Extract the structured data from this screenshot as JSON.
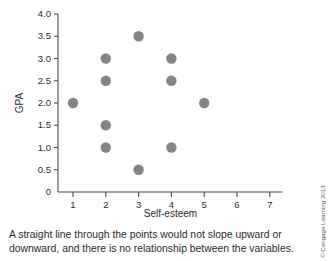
{
  "chart_data": {
    "type": "scatter",
    "title": "",
    "xlabel": "Self-esteem",
    "ylabel": "GPA",
    "xlim": [
      0,
      7.4
    ],
    "ylim": [
      0,
      4.0
    ],
    "grid": false,
    "legend": null,
    "xticks": [
      "1",
      "2",
      "3",
      "4",
      "5",
      "6",
      "7"
    ],
    "xtick_values": [
      1,
      2,
      3,
      4,
      5,
      6,
      7
    ],
    "yticks": [
      "0",
      "0.5",
      "1.0",
      "1.5",
      "2.0",
      "2.5",
      "3.0",
      "3.5",
      "4.0"
    ],
    "ytick_values": [
      0,
      0.5,
      1.0,
      1.5,
      2.0,
      2.5,
      3.0,
      3.5,
      4.0
    ],
    "points": [
      {
        "x": 1,
        "y": 2.0
      },
      {
        "x": 2,
        "y": 3.0
      },
      {
        "x": 2,
        "y": 2.5
      },
      {
        "x": 2,
        "y": 1.5
      },
      {
        "x": 2,
        "y": 1.0
      },
      {
        "x": 3,
        "y": 3.5
      },
      {
        "x": 3,
        "y": 0.5
      },
      {
        "x": 4,
        "y": 3.0
      },
      {
        "x": 4,
        "y": 2.5
      },
      {
        "x": 4,
        "y": 1.0
      },
      {
        "x": 5,
        "y": 2.0
      }
    ],
    "marker_color": "#858585",
    "marker_size": 5.2,
    "axis_color": "#4a4a4a"
  },
  "caption": {
    "text": "A straight line through the points would not slope upward or downward, and there is no relationship between the variables."
  },
  "credit": {
    "text": "© Cengage Learning 2013"
  }
}
